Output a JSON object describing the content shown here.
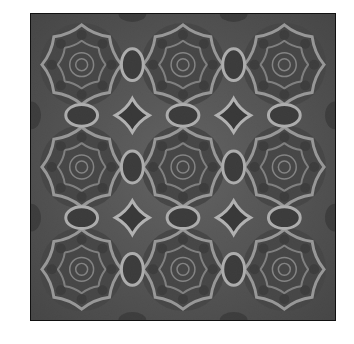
{
  "image": {
    "description": "Grayscale symmetric rosette tiling pattern, 3x3 grid",
    "grid": {
      "rows": 3,
      "cols": 3
    },
    "colors": {
      "dark": "#1a1a1a",
      "mid": "#555555",
      "light": "#cfcfcf",
      "border": "#111111"
    }
  }
}
